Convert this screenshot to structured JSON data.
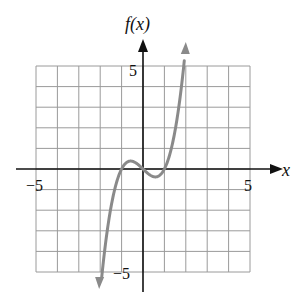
{
  "chart_data": {
    "type": "line",
    "title": "",
    "xlabel": "x",
    "ylabel": "f(x)",
    "xlim": [
      -5,
      5
    ],
    "ylim": [
      -5,
      5
    ],
    "grid": true,
    "x_ticks_labeled": [
      "-5",
      "5"
    ],
    "y_ticks_labeled": [
      "5",
      "-5"
    ],
    "series": [
      {
        "name": "f(x)",
        "color": "#8a8a8a",
        "function_approx": "x^3 - x",
        "arrows_at_ends": true,
        "x": [
          -2.0,
          -1.5,
          -1.0,
          -0.577,
          0.0,
          0.577,
          1.0,
          1.5,
          2.0
        ],
        "y": [
          -6.0,
          -1.875,
          0.0,
          0.385,
          0.0,
          -0.385,
          0.0,
          1.875,
          6.0
        ]
      }
    ],
    "annotations": []
  },
  "labels": {
    "y_axis": "f(x)",
    "x_axis": "x",
    "x_min": "−5",
    "x_max": "5",
    "y_max": "5",
    "y_min": "−5"
  }
}
